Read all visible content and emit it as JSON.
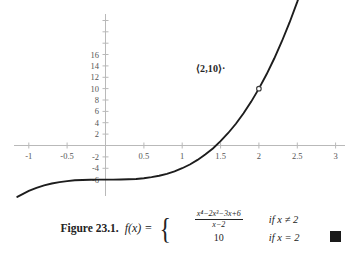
{
  "figure": {
    "caption_label": "Figure 23.1.",
    "function_lhs": "f(x) =",
    "cases": [
      {
        "value_numerator": "x⁴−2x³−3x+6",
        "value_denominator": "x−2",
        "condition": "if x ≠ 2"
      },
      {
        "value": "10",
        "condition": "if x = 2"
      }
    ],
    "qed_marker": "end-of-proof-square"
  },
  "annotation": {
    "point_label": "⟨2,10⟩",
    "point_dot": "·"
  },
  "chart_data": {
    "type": "line",
    "title": "",
    "xlabel": "",
    "ylabel": "",
    "xlim": [
      -1.3,
      3.15
    ],
    "ylim": [
      -6.8,
      17.2
    ],
    "xticks": [
      -1,
      -0.5,
      0.5,
      1,
      1.5,
      2,
      2.5,
      3
    ],
    "xtick_labels": [
      "-1",
      "-0.5",
      "0.5",
      "1",
      "1.5",
      "2",
      "2.5",
      "3"
    ],
    "yticks": [
      -6,
      -4,
      -2,
      2,
      4,
      6,
      8,
      10,
      12,
      14,
      16
    ],
    "ytick_labels": [
      "-6",
      "-4",
      "-2",
      "2",
      "4",
      "6",
      "8",
      "10",
      "12",
      "14",
      "16"
    ],
    "grid": false,
    "legend": "none",
    "axis_color": "#b9b9b9",
    "curve_color": "#1d1d1d",
    "series": [
      {
        "name": "f(x) = (x^4-2x^3-3x+6)/(x-2) = x^3-3",
        "x": [
          -1.15,
          -1.0,
          -0.9,
          -0.8,
          -0.7,
          -0.6,
          -0.5,
          -0.4,
          -0.3,
          -0.2,
          -0.1,
          0.0,
          0.1,
          0.2,
          0.3,
          0.4,
          0.5,
          0.6,
          0.7,
          0.8,
          0.9,
          1.0,
          1.1,
          1.2,
          1.3,
          1.4,
          1.5,
          1.6,
          1.7,
          1.8,
          1.9,
          2.0,
          2.1,
          2.2,
          2.3,
          2.4,
          2.5,
          2.6,
          2.7
        ],
        "y": [
          -4.52,
          -4.0,
          -3.73,
          -3.51,
          -3.34,
          -3.22,
          -3.13,
          -3.06,
          -3.03,
          -3.01,
          -3.0,
          -3.0,
          -3.0,
          -2.99,
          -2.97,
          -2.94,
          -2.88,
          -2.78,
          -2.66,
          -2.49,
          -2.27,
          -2.0,
          -1.67,
          -1.27,
          -0.8,
          -0.26,
          0.38,
          1.1,
          1.91,
          2.83,
          3.86,
          5.0,
          6.26,
          7.65,
          9.17,
          10.82,
          12.63,
          14.58,
          16.68
        ]
      }
    ],
    "markers": [
      {
        "kind": "open-circle-hole",
        "x": 2,
        "y": 5,
        "note": "removable discontinuity on curve at x=2"
      },
      {
        "kind": "filled-dot",
        "x": 2.12,
        "y": 10,
        "note": "defined value f(2)=10"
      }
    ]
  }
}
